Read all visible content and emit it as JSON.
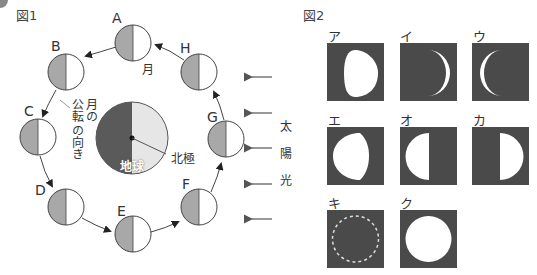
{
  "figure1": {
    "label": "図1",
    "moon_label": "月",
    "revolution_label": [
      "月の",
      "公転",
      "の向き"
    ],
    "earth_label": "地球",
    "north_pole_label": "北極",
    "sunlight_label": [
      "太",
      "陽",
      "光"
    ],
    "positions": [
      {
        "id": "A",
        "x": 133,
        "y": 43
      },
      {
        "id": "B",
        "x": 66,
        "y": 72
      },
      {
        "id": "C",
        "x": 38,
        "y": 137
      },
      {
        "id": "D",
        "x": 66,
        "y": 207
      },
      {
        "id": "E",
        "x": 133,
        "y": 234
      },
      {
        "id": "F",
        "x": 199,
        "y": 207
      },
      {
        "id": "G",
        "x": 226,
        "y": 139
      },
      {
        "id": "H",
        "x": 199,
        "y": 72
      }
    ]
  },
  "figure2": {
    "label": "図2",
    "phases": [
      {
        "id": "ア",
        "shape": "gibbous-left"
      },
      {
        "id": "イ",
        "shape": "crescent-right"
      },
      {
        "id": "ウ",
        "shape": "crescent-left"
      },
      {
        "id": "エ",
        "shape": "gibbous-left-wide"
      },
      {
        "id": "オ",
        "shape": "half-left"
      },
      {
        "id": "カ",
        "shape": "half-right"
      },
      {
        "id": "キ",
        "shape": "new-moon"
      },
      {
        "id": "ク",
        "shape": "full-moon"
      }
    ]
  },
  "colors": {
    "moon_dark": "#a8a8a8",
    "earth_dark": "#5a5a5a",
    "earth_light": "#e6e6e6",
    "panel_bg": "#4a4a4a"
  }
}
